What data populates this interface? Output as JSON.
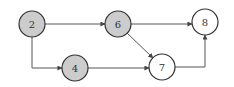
{
  "colors": {
    "visited_fill": "#cccccc",
    "unvisited_fill": "#ffffff",
    "stroke": "#333333",
    "edge": "#555555"
  },
  "nodes": [
    {
      "id": "2",
      "label": "2",
      "cx": 32,
      "cy": 24,
      "r": 13,
      "visited": true
    },
    {
      "id": "6",
      "label": "6",
      "cx": 118,
      "cy": 24,
      "r": 13,
      "visited": true
    },
    {
      "id": "8",
      "label": "8",
      "cx": 205,
      "cy": 22,
      "r": 13,
      "visited": false
    },
    {
      "id": "4",
      "label": "4",
      "cx": 75,
      "cy": 68,
      "r": 13,
      "visited": true
    },
    {
      "id": "7",
      "label": "7",
      "cx": 162,
      "cy": 67,
      "r": 13,
      "visited": false
    }
  ],
  "edges": [
    {
      "from": "2",
      "to": "6",
      "points": [
        [
          45,
          24
        ],
        [
          105,
          24
        ]
      ]
    },
    {
      "from": "2",
      "to": "4",
      "points": [
        [
          32,
          37
        ],
        [
          32,
          68
        ],
        [
          62,
          68
        ]
      ]
    },
    {
      "from": "6",
      "to": "8",
      "points": [
        [
          131,
          24
        ],
        [
          192,
          24
        ]
      ]
    },
    {
      "from": "6",
      "to": "7",
      "points": [
        [
          127,
          33
        ],
        [
          153,
          58
        ]
      ]
    },
    {
      "from": "4",
      "to": "7",
      "points": [
        [
          88,
          68
        ],
        [
          149,
          68
        ]
      ]
    },
    {
      "from": "7",
      "to": "8",
      "points": [
        [
          175,
          67
        ],
        [
          205,
          67
        ],
        [
          205,
          35
        ]
      ]
    }
  ]
}
